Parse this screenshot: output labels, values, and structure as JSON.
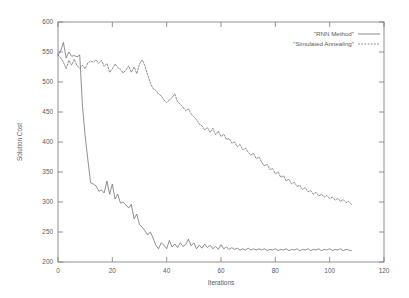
{
  "figure": {
    "background_color": "#ffffff",
    "line_color": "#6b6b6b",
    "axis_color": "#777777"
  },
  "chart_data": {
    "type": "line",
    "title": "",
    "subtitle": "",
    "xlabel": "Iterations",
    "ylabel": "Solution Cost",
    "xlim": [
      0,
      120
    ],
    "ylim": [
      200,
      600
    ],
    "xticks": [
      0,
      20,
      40,
      60,
      80,
      100,
      120
    ],
    "xtick_labels": [
      "0",
      "20",
      "40",
      "60",
      "80",
      "100",
      "120"
    ],
    "yticks": [
      200,
      250,
      300,
      350,
      400,
      450,
      500,
      550,
      600
    ],
    "ytick_labels": [
      "200",
      "250",
      "300",
      "350",
      "400",
      "450",
      "500",
      "550",
      "600"
    ],
    "grid": false,
    "legend_position": "top-right",
    "legend": [
      {
        "name": "\"RNN Method\"",
        "style": "solid",
        "color": "#6b6b6b"
      },
      {
        "name": "\"Simulated Annealing\"",
        "style": "dashed",
        "color": "#6b6b6b"
      }
    ],
    "series": [
      {
        "name": "\"RNN Method\"",
        "style": "solid",
        "color": "#6b6b6b",
        "x": [
          0,
          1,
          2,
          3,
          4,
          5,
          6,
          7,
          8,
          9,
          10,
          11,
          12,
          13,
          14,
          15,
          16,
          17,
          18,
          19,
          20,
          21,
          22,
          23,
          24,
          25,
          26,
          27,
          28,
          29,
          30,
          31,
          32,
          33,
          34,
          35,
          36,
          37,
          38,
          39,
          40,
          41,
          42,
          43,
          44,
          45,
          46,
          47,
          48,
          49,
          50,
          51,
          52,
          53,
          54,
          55,
          56,
          57,
          58,
          59,
          60,
          61,
          62,
          63,
          64,
          65,
          66,
          67,
          68,
          69,
          70,
          71,
          72,
          73,
          74,
          75,
          76,
          77,
          78,
          79,
          80,
          81,
          82,
          83,
          84,
          85,
          86,
          87,
          88,
          89,
          90,
          91,
          92,
          93,
          94,
          95,
          96,
          97,
          98,
          99,
          100,
          101,
          102,
          103,
          104,
          105,
          106,
          107,
          108
        ],
        "values": [
          545,
          552,
          566,
          540,
          550,
          543,
          544,
          542,
          545,
          460,
          410,
          370,
          332,
          330,
          327,
          318,
          320,
          315,
          335,
          313,
          330,
          305,
          313,
          298,
          300,
          295,
          290,
          296,
          272,
          280,
          262,
          258,
          252,
          245,
          250,
          240,
          228,
          222,
          232,
          228,
          222,
          236,
          225,
          230,
          224,
          232,
          226,
          229,
          238,
          227,
          232,
          222,
          228,
          223,
          230,
          224,
          228,
          222,
          226,
          221,
          229,
          222,
          225,
          221,
          224,
          221,
          223,
          220,
          222,
          220,
          223,
          220,
          222,
          220,
          222,
          220,
          222,
          219,
          221,
          220,
          222,
          219,
          221,
          220,
          222,
          219,
          221,
          220,
          222,
          219,
          221,
          220,
          222,
          219,
          221,
          220,
          222,
          219,
          221,
          220,
          222,
          219,
          221,
          220,
          222,
          219,
          221,
          220,
          219
        ]
      },
      {
        "name": "\"Simulated Annealing\"",
        "style": "dashed",
        "color": "#6b6b6b",
        "x": [
          0,
          1,
          2,
          3,
          4,
          5,
          6,
          7,
          8,
          9,
          10,
          11,
          12,
          13,
          14,
          15,
          16,
          17,
          18,
          19,
          20,
          21,
          22,
          23,
          24,
          25,
          26,
          27,
          28,
          29,
          30,
          31,
          32,
          33,
          34,
          35,
          36,
          37,
          38,
          39,
          40,
          41,
          42,
          43,
          44,
          45,
          46,
          47,
          48,
          49,
          50,
          51,
          52,
          53,
          54,
          55,
          56,
          57,
          58,
          59,
          60,
          61,
          62,
          63,
          64,
          65,
          66,
          67,
          68,
          69,
          70,
          71,
          72,
          73,
          74,
          75,
          76,
          77,
          78,
          79,
          80,
          81,
          82,
          83,
          84,
          85,
          86,
          87,
          88,
          89,
          90,
          91,
          92,
          93,
          94,
          95,
          96,
          97,
          98,
          99,
          100,
          101,
          102,
          103,
          104,
          105,
          106,
          107,
          108
        ],
        "values": [
          545,
          540,
          533,
          522,
          536,
          528,
          538,
          527,
          523,
          528,
          522,
          532,
          535,
          533,
          537,
          531,
          536,
          526,
          531,
          516,
          522,
          530,
          524,
          521,
          515,
          520,
          527,
          516,
          525,
          514,
          530,
          537,
          527,
          512,
          498,
          489,
          486,
          480,
          477,
          470,
          466,
          470,
          474,
          480,
          467,
          463,
          458,
          452,
          455,
          447,
          442,
          437,
          430,
          427,
          420,
          424,
          416,
          423,
          412,
          418,
          409,
          413,
          404,
          406,
          398,
          400,
          392,
          396,
          387,
          390,
          383,
          378,
          381,
          372,
          375,
          366,
          360,
          363,
          354,
          356,
          347,
          350,
          341,
          344,
          335,
          338,
          330,
          333,
          326,
          328,
          321,
          324,
          317,
          319,
          313,
          316,
          310,
          313,
          308,
          311,
          306,
          308,
          303,
          306,
          301,
          304,
          299,
          301,
          296
        ]
      }
    ]
  }
}
